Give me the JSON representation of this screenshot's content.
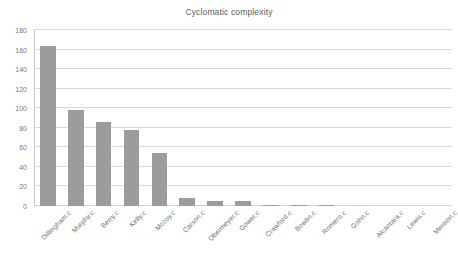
{
  "chart_data": {
    "type": "bar",
    "title": "Cyclomatic complexity",
    "xlabel": "",
    "ylabel": "",
    "ylim": [
      0,
      180
    ],
    "ytick_step": 20,
    "yticks": [
      0,
      20,
      40,
      60,
      80,
      100,
      120,
      140,
      160,
      180
    ],
    "grid": true,
    "legend": false,
    "bar_color": "#9c9c9c",
    "grid_color": "#d9d9d9",
    "text_color": "#7a7a7a",
    "background": "#ffffff",
    "categories": [
      "Dillingham.c",
      "Murphy.c",
      "Berry.c",
      "Kelly.c",
      "Mccoy.c",
      "Carson.c",
      "Obermeyer.c",
      "Gower.c",
      "Crawford.c",
      "Bowlin.c",
      "Romero.c",
      "Gohn.c",
      "Alcantara.c",
      "Lewis.c",
      "Mention.c"
    ],
    "values": [
      164,
      98,
      86,
      78,
      54,
      8,
      5,
      5,
      1,
      1,
      1,
      0,
      0,
      0,
      0
    ]
  }
}
